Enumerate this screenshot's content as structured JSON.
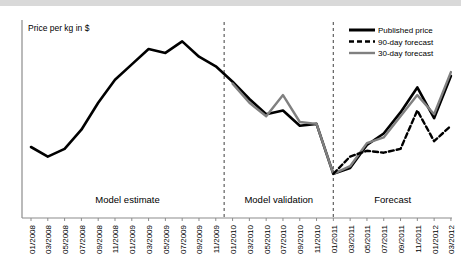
{
  "chart_data": {
    "type": "line",
    "title": "",
    "xlabel": "",
    "ylabel": "Price per kg in $",
    "grid": false,
    "legend_position": "top-right",
    "ylim": [
      0,
      100
    ],
    "categories": [
      "01/2008",
      "03/2008",
      "05/2008",
      "07/2008",
      "09/2008",
      "11/2008",
      "01/2009",
      "03/2009",
      "05/2009",
      "07/2009",
      "09/2009",
      "11/2009",
      "01/2010",
      "03/2010",
      "05/2010",
      "07/2010",
      "09/2010",
      "11/2010",
      "01/2011",
      "03/2011",
      "05/2011",
      "07/2011",
      "09/2011",
      "11/2011",
      "01/2012",
      "03/2012"
    ],
    "series": [
      {
        "name": "Published price",
        "style": "solid",
        "color": "#000000",
        "width": 2.6,
        "values": [
          37,
          32,
          36,
          46,
          60,
          72,
          80,
          88,
          86,
          92,
          84,
          79,
          71,
          62,
          54,
          56,
          48,
          49,
          46,
          31,
          28,
          25,
          23,
          24,
          22,
          21
        ]
      },
      {
        "name": "90-day forecast",
        "style": "dashed",
        "color": "#000000",
        "width": 2.4,
        "values": [
          null,
          null,
          null,
          null,
          null,
          null,
          null,
          null,
          null,
          null,
          null,
          null,
          null,
          null,
          null,
          null,
          null,
          null,
          23,
          30,
          35,
          34,
          35,
          45,
          58,
          50
        ]
      },
      {
        "name": "30-day forecast",
        "style": "solid",
        "color": "#808080",
        "width": 2.4,
        "values": [
          null,
          null,
          null,
          null,
          null,
          null,
          null,
          null,
          null,
          null,
          null,
          null,
          70,
          60,
          53,
          64,
          50,
          49,
          47,
          33,
          26,
          24,
          25,
          27,
          24,
          23
        ]
      }
    ],
    "forecast_x": [
      "01/2011",
      "03/2011",
      "05/2011",
      "07/2011",
      "09/2011",
      "11/2011",
      "01/2012",
      "03/2012"
    ],
    "published_forecast_values": [
      23,
      26,
      38,
      44,
      55,
      68,
      52,
      74
    ],
    "gray_forecast_values": [
      23,
      27,
      39,
      42,
      53,
      64,
      54,
      76
    ],
    "dashed_forecast_values": [
      23,
      32,
      35,
      34,
      36,
      56,
      40,
      48
    ],
    "annotations": [
      {
        "label": "Model estimate",
        "from": "01/2008",
        "to": "11/2009"
      },
      {
        "label": "Model validation",
        "from": "01/2010",
        "to": "11/2010"
      },
      {
        "label": "Forecast",
        "from": "01/2011",
        "to": "03/2012"
      }
    ],
    "dividers": [
      "12/2009",
      "01/2011"
    ]
  },
  "axis": {
    "y_title": "Price per kg in $"
  },
  "regions": [
    {
      "label": "Model estimate"
    },
    {
      "label": "Model validation"
    },
    {
      "label": "Forecast"
    }
  ],
  "legend": {
    "items": [
      {
        "label": "Published price",
        "swatch": "solid-black-line-icon"
      },
      {
        "label": "90-day forecast",
        "swatch": "dashed-black-line-icon"
      },
      {
        "label": "30-day forecast",
        "swatch": "solid-gray-line-icon"
      }
    ]
  }
}
